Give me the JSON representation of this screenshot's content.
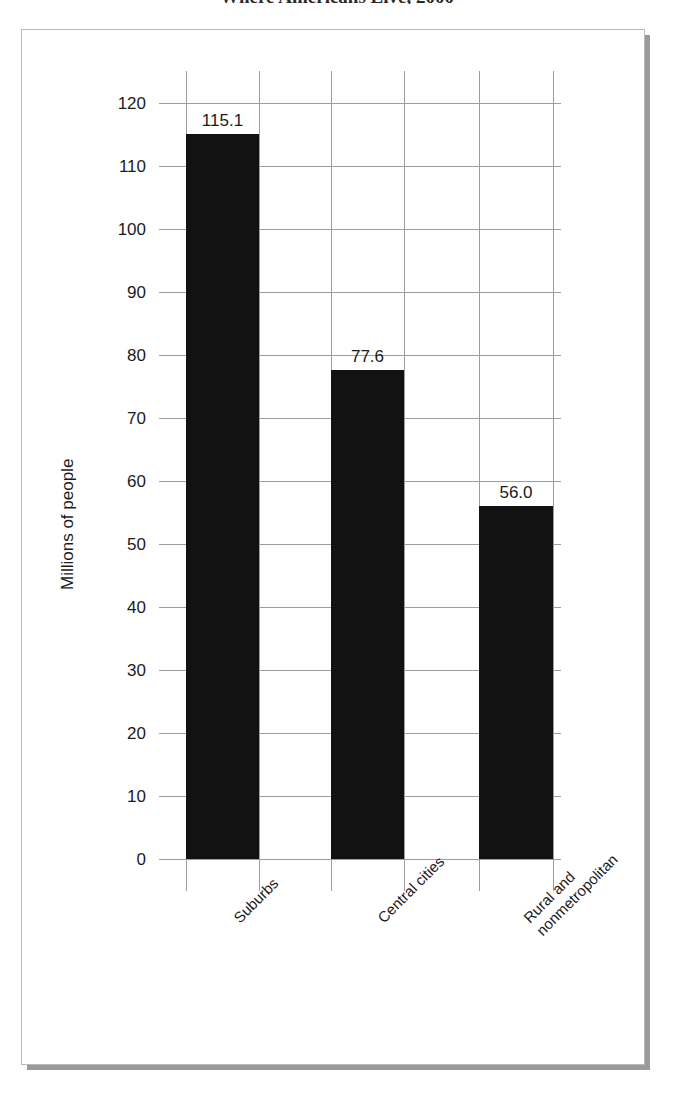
{
  "figure": {
    "title_sliver": "Where Americans Live, 2000",
    "frame_style": "boxed-with-drop-shadow"
  },
  "chart_data": {
    "type": "bar",
    "title": "Where Americans Live, 2000",
    "xlabel": "",
    "ylabel": "Millions of people",
    "categories": [
      "Suburbs",
      "Central cities",
      "Rural and\nnonmetropolitan"
    ],
    "values": [
      115.1,
      77.6,
      56.0
    ],
    "value_labels": [
      "115.1",
      "77.6",
      "56.0"
    ],
    "ylim": [
      0,
      120
    ],
    "ytick_step": 10,
    "yticks": [
      120,
      110,
      100,
      90,
      80,
      70,
      60,
      50,
      40,
      30,
      20,
      10,
      0
    ],
    "ytick_labels": [
      "120",
      "110",
      "100",
      "90",
      "80",
      "70",
      "60",
      "50",
      "40",
      "30",
      "20",
      "10",
      "0"
    ],
    "grid": "both",
    "legend": "none",
    "bar_color": "#121212",
    "grid_color": "#9d9d9d",
    "background": "#ffffff"
  }
}
